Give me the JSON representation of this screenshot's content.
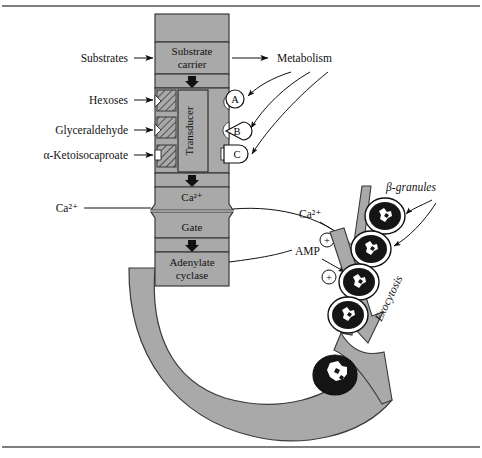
{
  "figure": {
    "type": "biological-pathway-diagram",
    "frame": {
      "top_rule": true,
      "bottom_rule": true,
      "background": "#ffffff"
    }
  },
  "colors": {
    "organelle_fill": "#a9a9a9",
    "organelle_stroke": "#3a3a3a",
    "granule_core": "#151515",
    "granule_ring": "#ffffff",
    "line": "#111111",
    "page": "#ffffff"
  },
  "left_labels": [
    {
      "id": "substrates",
      "text": "Substrates",
      "target": "substrate-carrier"
    },
    {
      "id": "hexoses",
      "text": "Hexoses",
      "target": "channel-a"
    },
    {
      "id": "glyceraldehyde",
      "text": "Glyceraldehyde",
      "target": "channel-b"
    },
    {
      "id": "ketoisocaproate",
      "text": "α-Ketoisocaproate",
      "target": "channel-c"
    },
    {
      "id": "calcium-left",
      "text": "Ca²⁺",
      "target": "gate"
    }
  ],
  "column_boxes": [
    {
      "id": "substrate-carrier",
      "lines": [
        "Substrate",
        "carrier"
      ]
    },
    {
      "id": "transducer",
      "lines": [
        "Transducer"
      ],
      "orientation": "vertical"
    },
    {
      "id": "calcium-box",
      "lines": [
        "Ca²⁺"
      ]
    },
    {
      "id": "gate",
      "lines": [
        "Gate"
      ]
    },
    {
      "id": "adenylate-cyclase",
      "lines": [
        "Adenylate",
        "cyclase"
      ]
    }
  ],
  "receptor_sites": [
    {
      "id": "site-a",
      "label": "A",
      "shape": "circle"
    },
    {
      "id": "site-b",
      "label": "B",
      "shape": "circle-with-triangular-notch"
    },
    {
      "id": "site-c",
      "label": "C",
      "shape": "circle-with-square-notch"
    }
  ],
  "right_labels": [
    {
      "id": "metabolism",
      "text": "Metabolism"
    },
    {
      "id": "calcium-right",
      "text": "Ca²⁺"
    },
    {
      "id": "amp",
      "text": "AMP"
    },
    {
      "id": "beta-granules",
      "text": "β-granules"
    },
    {
      "id": "exocytosis",
      "text": "Exocytosis",
      "rotated": true
    }
  ],
  "plus_signs": [
    {
      "id": "plus-calcium",
      "symbol": "+"
    },
    {
      "id": "plus-amp",
      "symbol": "+"
    }
  ],
  "granules": {
    "count_in_queue": 4,
    "count_fusing": 1,
    "description": "dark ovoid granules with white halo ring and crystalline white core"
  },
  "arrows": {
    "metabolism_to_sites": 3,
    "substrate_inflow": 1,
    "channel_inflow": 3,
    "internal_downward": 2,
    "granule_pointers": 2,
    "exocytosis_big_arrow": 1
  }
}
